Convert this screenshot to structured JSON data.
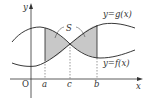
{
  "diagram": {
    "axes": {
      "x_label": "x",
      "y_label": "y",
      "origin_label": "O"
    },
    "points": [
      {
        "id": "a",
        "label": "a"
      },
      {
        "id": "c",
        "label": "c"
      },
      {
        "id": "b",
        "label": "b"
      }
    ],
    "curves": [
      {
        "id": "g",
        "label": "y=g(x)"
      },
      {
        "id": "f",
        "label": "y=f(x)"
      }
    ],
    "region_label": "S",
    "colors": {
      "curve": "#222222",
      "shade": "#c8c8c8",
      "axis": "#333333",
      "dashed": "#555555"
    }
  }
}
